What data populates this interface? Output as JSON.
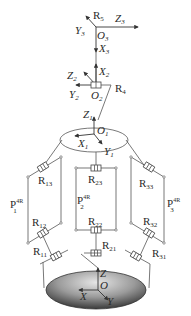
{
  "diagram": {
    "type": "parallel-serial robot kinematic schematic",
    "top_frame": {
      "joint": "R5",
      "origin": "O3",
      "axes": {
        "x": "X3",
        "y": "Y3",
        "z": "Z3"
      }
    },
    "mid_frame": {
      "joint": "R4",
      "origin": "O2",
      "axes": {
        "x": "X2",
        "y": "Y2",
        "z": "Z2"
      }
    },
    "platform_frame": {
      "origin": "O1",
      "axes": {
        "x": "X1",
        "y": "Y1",
        "z": "Z1"
      }
    },
    "base_frame": {
      "origin": "O",
      "axes": {
        "x": "X",
        "y": "Y",
        "z": "Z"
      }
    },
    "limbs": [
      {
        "name": "P",
        "index": "1",
        "sup": "4R",
        "joints": [
          "R11",
          "R12",
          "R13"
        ]
      },
      {
        "name": "P",
        "index": "2",
        "sup": "4R",
        "joints": [
          "R21",
          "R22",
          "R23"
        ]
      },
      {
        "name": "P",
        "index": "3",
        "sup": "4R",
        "joints": [
          "R31",
          "R32",
          "R33"
        ]
      }
    ],
    "colors": {
      "line": "#555555",
      "base_fill_dark": "#3a3a3a",
      "base_fill_light": "#d8d8d8"
    }
  },
  "labels": {
    "R5": {
      "main": "R",
      "sub": "5"
    },
    "Z3": {
      "main": "Z",
      "sub": "3"
    },
    "Y3": {
      "main": "Y",
      "sub": "3"
    },
    "O3": {
      "main": "O",
      "sub": "3"
    },
    "X3": {
      "main": "X",
      "sub": "3"
    },
    "X2": {
      "main": "X",
      "sub": "2"
    },
    "Z2": {
      "main": "Z",
      "sub": "2"
    },
    "R4": {
      "main": "R",
      "sub": "4"
    },
    "Y2": {
      "main": "Y",
      "sub": "2"
    },
    "O2": {
      "main": "O",
      "sub": "2"
    },
    "Z1": {
      "main": "Z",
      "sub": "1"
    },
    "O1": {
      "main": "O",
      "sub": "1"
    },
    "X1": {
      "main": "X",
      "sub": "1"
    },
    "Y1": {
      "main": "Y",
      "sub": "1"
    },
    "R13": {
      "main": "R",
      "sub": "13"
    },
    "R12": {
      "main": "R",
      "sub": "12"
    },
    "R11": {
      "main": "R",
      "sub": "11"
    },
    "R23": {
      "main": "R",
      "sub": "23"
    },
    "R22": {
      "main": "R",
      "sub": "22"
    },
    "R21": {
      "main": "R",
      "sub": "21"
    },
    "R33": {
      "main": "R",
      "sub": "33"
    },
    "R32": {
      "main": "R",
      "sub": "32"
    },
    "R31": {
      "main": "R",
      "sub": "31"
    },
    "P1": {
      "main": "P",
      "sub": "1",
      "sup": "4R"
    },
    "P2": {
      "main": "P",
      "sub": "2",
      "sup": "4R"
    },
    "P3": {
      "main": "P",
      "sub": "3",
      "sup": "4R"
    },
    "Z": {
      "main": "Z"
    },
    "O": {
      "main": "O"
    },
    "X": {
      "main": "X"
    },
    "Y": {
      "main": "Y"
    }
  }
}
